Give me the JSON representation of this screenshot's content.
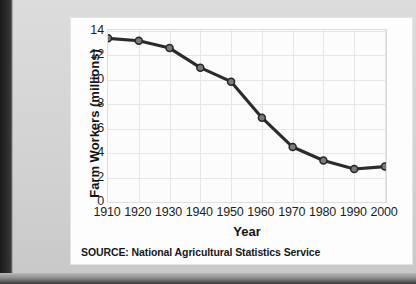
{
  "figure": {
    "source_note": "SOURCE: National Agricultural Statistics Service"
  },
  "chart_data": {
    "type": "line",
    "title": "",
    "xlabel": "Year",
    "ylabel": "Farm Workers (millions)",
    "categories": [
      "1910",
      "1920",
      "1930",
      "1940",
      "1950",
      "1960",
      "1970",
      "1980",
      "1990",
      "2000"
    ],
    "x": [
      1910,
      1920,
      1930,
      1940,
      1950,
      1960,
      1970,
      1980,
      1990,
      2000
    ],
    "values": [
      13.4,
      13.2,
      12.6,
      11.0,
      9.85,
      6.9,
      4.5,
      3.4,
      2.7,
      2.9
    ],
    "series": [
      {
        "name": "Farm Workers",
        "values": [
          13.4,
          13.2,
          12.6,
          11.0,
          9.85,
          6.9,
          4.5,
          3.4,
          2.7,
          2.9
        ]
      }
    ],
    "xlim": [
      1910,
      2000
    ],
    "ylim": [
      0,
      14
    ],
    "ytick_labels": [
      "0",
      "2",
      "4",
      "6",
      "8",
      "10",
      "12",
      "14"
    ],
    "yticks": [
      0,
      2,
      4,
      6,
      8,
      10,
      12,
      14
    ],
    "xtick_labels": [
      "1910",
      "1920",
      "1930",
      "1940",
      "1950",
      "1960",
      "1970",
      "1980",
      "1990",
      "2000"
    ],
    "grid": true,
    "legend": "none",
    "line_color": "#2b2b2b",
    "marker_fill": "#7a7a7a",
    "marker_edge": "#262626",
    "grid_color": "#e6e6e4",
    "plot_background": "#fcfcfc",
    "figure_background": "#fdfdfd",
    "annotations": []
  }
}
